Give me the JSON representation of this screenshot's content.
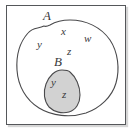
{
  "figure": {
    "type": "venn-diagram",
    "caption": "",
    "frame": {
      "border_color": "#55575a",
      "background": "#ffffff"
    }
  },
  "sets": [
    {
      "key": "A",
      "label": "A",
      "label_position": {
        "x": 46,
        "y": 15
      },
      "fill": "#ffffff",
      "stroke": "#4a4a4c",
      "nested_inside": null
    },
    {
      "key": "B",
      "label": "B",
      "label_position": {
        "x": 56,
        "y": 60
      },
      "fill": "#d2d2d2",
      "stroke": "#4a4a4c",
      "nested_inside": "A"
    }
  ],
  "elements": [
    {
      "label": "y",
      "set": "A",
      "x": 40,
      "y": 44
    },
    {
      "label": "x",
      "set": "A",
      "x": 63,
      "y": 31
    },
    {
      "label": "w",
      "set": "A",
      "x": 87,
      "y": 38
    },
    {
      "label": "z",
      "set": "A",
      "x": 69,
      "y": 51
    },
    {
      "label": "y",
      "set": "B",
      "x": 53,
      "y": 82
    },
    {
      "label": "z",
      "set": "B",
      "x": 64,
      "y": 94
    }
  ],
  "colors": {
    "inner_fill": "#d2d2d2",
    "outline": "#4a4a4c",
    "frame": "#55575a",
    "text": "#39393b",
    "background": "#ffffff"
  }
}
